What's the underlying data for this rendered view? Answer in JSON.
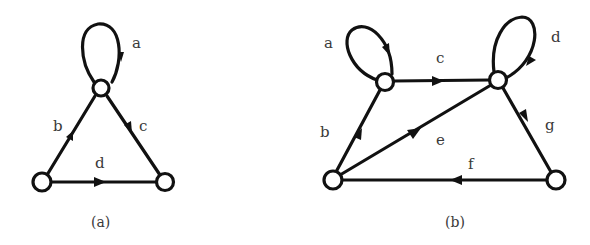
{
  "colors": {
    "stroke": "#111111",
    "background": "#ffffff",
    "label": "#3a3a3a"
  },
  "graphs": [
    {
      "caption": "(a)",
      "nodes": [
        {
          "id": "top",
          "x": 101,
          "y": 88
        },
        {
          "id": "bottom-left",
          "x": 42,
          "y": 182
        },
        {
          "id": "bottom-right",
          "x": 165,
          "y": 182
        }
      ],
      "edges": [
        {
          "label": "a",
          "from": "top",
          "to": "top",
          "kind": "self-loop"
        },
        {
          "label": "b",
          "from": "bottom-left",
          "to": "top"
        },
        {
          "label": "c",
          "from": "top",
          "to": "bottom-right"
        },
        {
          "label": "d",
          "from": "bottom-left",
          "to": "bottom-right"
        }
      ]
    },
    {
      "caption": "(b)",
      "nodes": [
        {
          "id": "top-left",
          "x": 385,
          "y": 82
        },
        {
          "id": "top-right",
          "x": 498,
          "y": 80
        },
        {
          "id": "bottom-left",
          "x": 333,
          "y": 180
        },
        {
          "id": "bottom-right",
          "x": 556,
          "y": 180
        }
      ],
      "edges": [
        {
          "label": "a",
          "from": "top-left",
          "to": "top-left",
          "kind": "self-loop"
        },
        {
          "label": "b",
          "from": "bottom-left",
          "to": "top-left"
        },
        {
          "label": "c",
          "from": "top-left",
          "to": "top-right"
        },
        {
          "label": "d",
          "from": "top-right",
          "to": "top-right",
          "kind": "self-loop"
        },
        {
          "label": "e",
          "from": "bottom-left",
          "to": "top-right"
        },
        {
          "label": "f",
          "from": "bottom-right",
          "to": "bottom-left"
        },
        {
          "label": "g",
          "from": "top-right",
          "to": "bottom-right"
        }
      ]
    }
  ]
}
